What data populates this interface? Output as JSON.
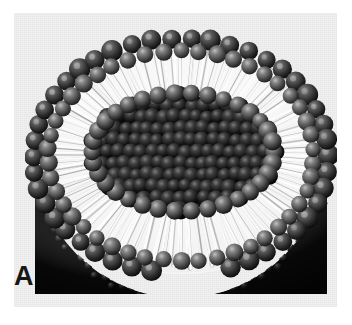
{
  "figure": {
    "panel_label": "A",
    "caption_visible": "",
    "background_color": "#f1f1f1",
    "page_color": "#ffffff",
    "rendering": "grayscale space-filling molecular illustration"
  },
  "plate": {
    "x": 14,
    "y": 13,
    "width": 323,
    "height": 294
  },
  "structure": {
    "outer_leaflet": {
      "name": "outer-leaflet-headgroups",
      "description": "ring of dark spheres forming the outer polar head group surface",
      "color_dark": "#2b2b2b",
      "color_mid": "#555555",
      "color_highlight": "#9a9a9a",
      "bead_count_rim": 34
    },
    "tails": {
      "name": "hydrocarbon-tails",
      "description": "white radiating hydrophobic acyl chains between the two leaflets",
      "color": "#fdfdfd",
      "shadow_color": "#7c7c7c",
      "count": 88
    },
    "inner_leaflet": {
      "name": "inner-leaflet-headgroups",
      "description": "dark spheres lining the aqueous interior cavity",
      "color_dark": "#181818",
      "color_highlight": "#8d8d8d",
      "bead_count_rim": 26
    },
    "lower_hemisphere": {
      "name": "outer-surface-hemisphere",
      "description": "densely hexagonally packed head group spheres of the intact lower half",
      "color_dark": "#0d0d0d",
      "color_highlight": "#b4b4b4",
      "bead_count": 430
    },
    "interior_cavity": {
      "name": "aqueous-lumen",
      "color": "#101010"
    }
  },
  "geometry": {
    "vesicle_center_x": 176,
    "vesicle_center_y": 155,
    "vesicle_radius": 131,
    "cut_plane_top_y": 22,
    "cut_plane_bottom_y": 284,
    "lumen_rx": 78,
    "lumen_ry": 48
  }
}
